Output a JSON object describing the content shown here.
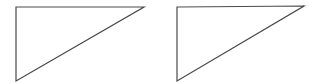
{
  "canvas": {
    "width": 316,
    "height": 84,
    "background": "#ffffff"
  },
  "stroke_color": "#4a4a4a",
  "shapes": [
    {
      "name": "left-triangle",
      "points": "16,7 144,7 16,81"
    },
    {
      "name": "right-triangle",
      "points": "177,7 304,6 177,81"
    }
  ]
}
